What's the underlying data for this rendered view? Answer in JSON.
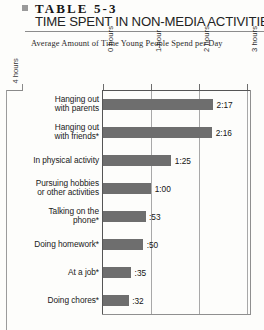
{
  "header": {
    "bullet_icon": "square-bullet-icon",
    "table_number": "TABLE 5-3",
    "table_title": "TIME SPENT IN NON-MEDIA ACTIVITIES"
  },
  "subtitle": "Average Amount of Time Young People Spend per Day",
  "artifact": {
    "label": "4 hours"
  },
  "chart_data": {
    "type": "bar",
    "orientation": "horizontal",
    "title": "TIME SPENT IN NON-MEDIA ACTIVITIES",
    "subtitle": "Average Amount of Time Young People Spend per Day",
    "xlabel": "",
    "ylabel": "",
    "xlim": [
      0,
      3.1
    ],
    "grid": true,
    "legend": "none",
    "axis_ticks": [
      {
        "value": 0,
        "label": "0 hours"
      },
      {
        "value": 1,
        "label": "1 hour"
      },
      {
        "value": 2,
        "label": "2 hours"
      },
      {
        "value": 3,
        "label": "3 hours"
      }
    ],
    "categories": [
      "Hanging out with parents",
      "Hanging out with friends*",
      "In physical activity",
      "Pursuing hobbies or other activities",
      "Talking on the phone*",
      "Doing homework*",
      "At a job*",
      "Doing chores*"
    ],
    "value_labels": [
      "2:17",
      "2:16",
      "1:25",
      "1:00",
      ":53",
      ":50",
      ":35",
      ":32"
    ],
    "values": [
      2.2833,
      2.2667,
      1.4167,
      1.0,
      0.8833,
      0.8333,
      0.5833,
      0.5333
    ],
    "units": "hours:minutes per day"
  },
  "rows": [
    {
      "label_line1": "Hanging out",
      "label_line2": "with parents",
      "value": "2:17"
    },
    {
      "label_line1": "Hanging out",
      "label_line2": "with friends*",
      "value": "2:16"
    },
    {
      "label_line1": "In physical activity",
      "label_line2": "",
      "value": "1:25"
    },
    {
      "label_line1": "Pursuing hobbies",
      "label_line2": "or other activities",
      "value": "1:00"
    },
    {
      "label_line1": "Talking on the",
      "label_line2": "phone*",
      "value": ":53"
    },
    {
      "label_line1": "Doing homework*",
      "label_line2": "",
      "value": ":50"
    },
    {
      "label_line1": "At a job*",
      "label_line2": "",
      "value": ":35"
    },
    {
      "label_line1": "Doing chores*",
      "label_line2": "",
      "value": ":32"
    }
  ],
  "colors": {
    "bar": "#6e6e6e",
    "page": "#fdfdfb",
    "text": "#1b1b1b",
    "rule": "#8c8c8c",
    "grid": "#a8a8a8"
  }
}
